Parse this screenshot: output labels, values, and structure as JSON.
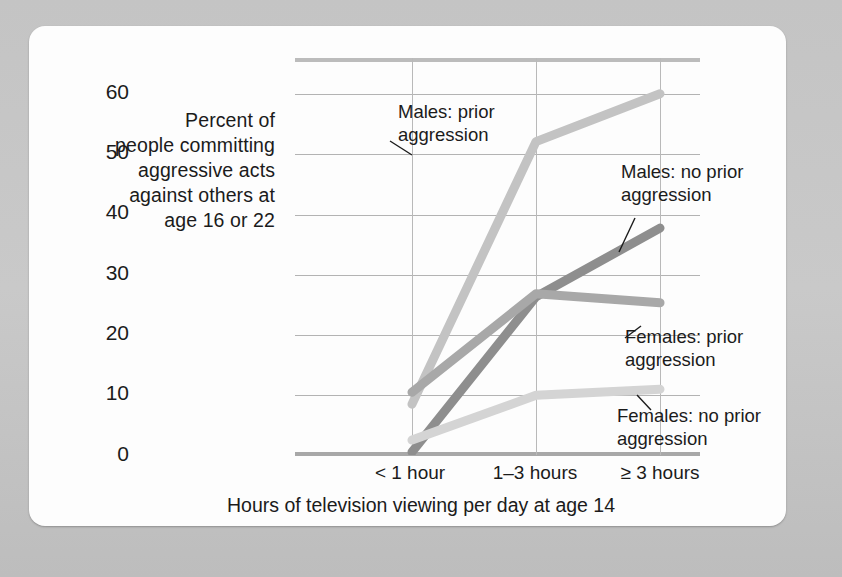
{
  "figure": {
    "background_color": "#c9c9c9",
    "card_color": "#fdfdfd"
  },
  "chart_data": {
    "type": "line",
    "title": "",
    "xlabel": "Hours of television viewing per day at age 14",
    "ylabel": "Percent of people committing aggressive acts against others at age 16 or 22",
    "categories": [
      "< 1 hour",
      "1–3 hours",
      "≥ 3 hours"
    ],
    "ylim": [
      0,
      66
    ],
    "yticks": [
      0,
      10,
      20,
      30,
      40,
      50,
      60
    ],
    "ytick_labels": [
      "0",
      "10",
      "20",
      "30",
      "40",
      "50",
      "60"
    ],
    "grid": true,
    "legend_position": "inline-annotations",
    "series": [
      {
        "name": "Males: prior aggression",
        "values": [
          8,
          52,
          60
        ],
        "color": "#c3c3c3"
      },
      {
        "name": "Males: no prior aggression",
        "values": [
          0,
          26,
          37.5
        ],
        "color": "#8e8e8e"
      },
      {
        "name": "Females: prior aggression",
        "values": [
          10,
          26.5,
          25
        ],
        "color": "#a8a8a8"
      },
      {
        "name": "Females: no prior aggression",
        "values": [
          2,
          9.5,
          10.5
        ],
        "color": "#d4d4d4"
      }
    ],
    "annotations": [
      {
        "label": "Males: prior\naggression",
        "target_series": "Males: prior aggression"
      },
      {
        "label": "Males: no prior\naggression",
        "target_series": "Males: no prior aggression"
      },
      {
        "label": "Females: prior\naggression",
        "target_series": "Females: prior aggression"
      },
      {
        "label": "Females: no prior\naggression",
        "target_series": "Females: no prior aggression"
      }
    ]
  },
  "axis": {
    "y_title": "Percent of\npeople committing\naggressive acts\nagainst others at\nage 16 or 22",
    "x_title": "Hours of television viewing per day at age 14",
    "ytick_0": "0",
    "ytick_10": "10",
    "ytick_20": "20",
    "ytick_30": "30",
    "ytick_40": "40",
    "ytick_50": "50",
    "ytick_60": "60",
    "xtick_0": "< 1 hour",
    "xtick_1": "1–3 hours",
    "xtick_2": "≥ 3 hours"
  },
  "annotations": {
    "males_prior": "Males: prior\naggression",
    "males_no_prior": "Males: no prior\naggression",
    "females_prior": "Females: prior\naggression",
    "females_no_prior": "Females: no prior\naggression"
  }
}
